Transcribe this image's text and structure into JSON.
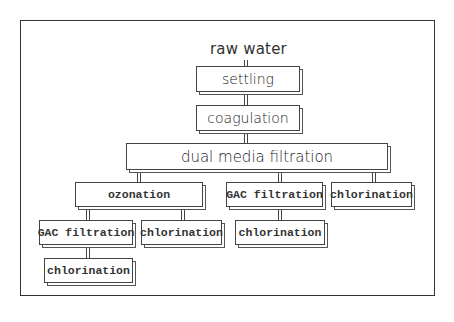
{
  "diagram": {
    "type": "process-tree",
    "root_label": "raw water",
    "nodes": {
      "settling": "settling",
      "coagulation": "coagulation",
      "dual_media": "dual media filtration",
      "ozonation": "ozonation",
      "gac_right": "GAC filtration",
      "chlor_right_top": "chlorination",
      "gac_left": "GAC filtration",
      "chlor_mid": "chlorination",
      "chlor_right_bottom": "chlorination",
      "chlor_bottom_left": "chlorination"
    },
    "edges": [
      [
        "raw water",
        "settling"
      ],
      [
        "settling",
        "coagulation"
      ],
      [
        "coagulation",
        "dual media filtration"
      ],
      [
        "dual media filtration",
        "ozonation"
      ],
      [
        "dual media filtration",
        "GAC filtration (right)"
      ],
      [
        "dual media filtration",
        "chlorination (right top)"
      ],
      [
        "ozonation",
        "GAC filtration (left)"
      ],
      [
        "ozonation",
        "chlorination (mid)"
      ],
      [
        "GAC filtration (right)",
        "chlorination (right bottom)"
      ],
      [
        "GAC filtration (left)",
        "chlorination (bottom left)"
      ]
    ]
  }
}
